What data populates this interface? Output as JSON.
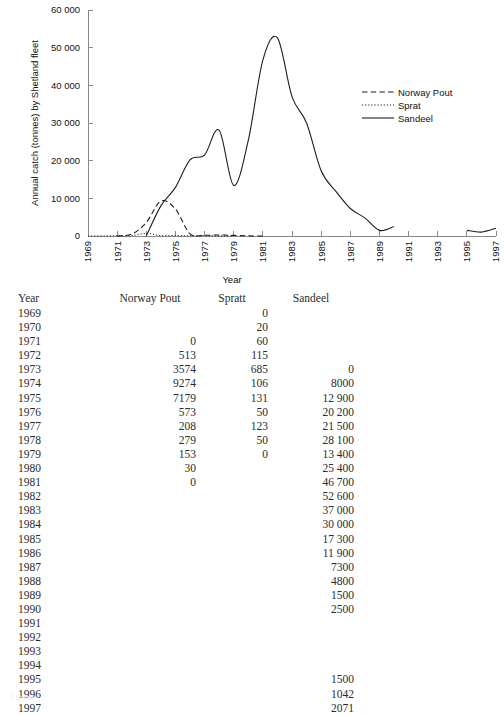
{
  "chart_data": {
    "type": "line",
    "title": "",
    "xlabel": "Year",
    "ylabel": "Annual catch (tonnes) by Shetland fleet",
    "xlim": [
      1969,
      1997
    ],
    "ylim": [
      0,
      60000
    ],
    "grid": false,
    "legend_position": "right",
    "x_ticks": [
      1969,
      1971,
      1973,
      1975,
      1977,
      1979,
      1981,
      1983,
      1985,
      1987,
      1989,
      1991,
      1993,
      1995,
      1997
    ],
    "x_tick_labels": [
      "1969",
      "1971",
      "1973",
      "1975",
      "1977",
      "1979",
      "1981",
      "1983",
      "1985",
      "1987",
      "1989",
      "1991",
      "1993",
      "1995",
      "1997"
    ],
    "y_ticks": [
      0,
      10000,
      20000,
      30000,
      40000,
      50000,
      60000
    ],
    "y_tick_labels": [
      "0",
      "10 000",
      "20 000",
      "30 000",
      "40 000",
      "50 000",
      "60 000"
    ],
    "x": [
      1969,
      1970,
      1971,
      1972,
      1973,
      1974,
      1975,
      1976,
      1977,
      1978,
      1979,
      1980,
      1981,
      1982,
      1983,
      1984,
      1985,
      1986,
      1987,
      1988,
      1989,
      1990,
      1991,
      1992,
      1993,
      1994,
      1995,
      1996,
      1997
    ],
    "series": [
      {
        "name": "Norway Pout",
        "style": "dashed",
        "color": "#1f1f1f",
        "x": [
          1971,
          1972,
          1973,
          1974,
          1975,
          1976,
          1977,
          1978,
          1979,
          1980,
          1981
        ],
        "values": [
          0,
          513,
          3574,
          9274,
          7179,
          573,
          208,
          279,
          153,
          30,
          0
        ]
      },
      {
        "name": "Sprat",
        "style": "dotted",
        "color": "#1f1f1f",
        "x": [
          1969,
          1970,
          1971,
          1972,
          1973,
          1974,
          1975,
          1976,
          1977,
          1978,
          1979
        ],
        "values": [
          0,
          20,
          60,
          115,
          685,
          106,
          131,
          50,
          123,
          50,
          0
        ]
      },
      {
        "name": "Sandeel",
        "style": "solid",
        "color": "#1f1f1f",
        "x": [
          1973,
          1974,
          1975,
          1976,
          1977,
          1978,
          1979,
          1980,
          1981,
          1982,
          1983,
          1984,
          1985,
          1986,
          1987,
          1988,
          1989,
          1990,
          1995,
          1996,
          1997
        ],
        "values": [
          0,
          8000,
          12900,
          20200,
          21500,
          28100,
          13400,
          25400,
          46700,
          52600,
          37000,
          30000,
          17300,
          11900,
          7300,
          4800,
          1500,
          2500,
          1500,
          1042,
          2071
        ]
      }
    ]
  },
  "legend": {
    "items": [
      {
        "label": "Norway Pout",
        "style": "dashed"
      },
      {
        "label": "Sprat",
        "style": "dotted"
      },
      {
        "label": "Sandeel",
        "style": "solid"
      }
    ]
  },
  "table": {
    "headers": [
      "Year",
      "Norway Pout",
      "Spratt",
      "Sandeel"
    ],
    "rows": [
      {
        "year": "1969",
        "pout": "",
        "spratt": "0",
        "sandeel": ""
      },
      {
        "year": "1970",
        "pout": "",
        "spratt": "20",
        "sandeel": ""
      },
      {
        "year": "1971",
        "pout": "0",
        "spratt": "60",
        "sandeel": ""
      },
      {
        "year": "1972",
        "pout": "513",
        "spratt": "115",
        "sandeel": ""
      },
      {
        "year": "1973",
        "pout": "3574",
        "spratt": "685",
        "sandeel": "0"
      },
      {
        "year": "1974",
        "pout": "9274",
        "spratt": "106",
        "sandeel": "8000"
      },
      {
        "year": "1975",
        "pout": "7179",
        "spratt": "131",
        "sandeel": "12 900"
      },
      {
        "year": "1976",
        "pout": "573",
        "spratt": "50",
        "sandeel": "20 200"
      },
      {
        "year": "1977",
        "pout": "208",
        "spratt": "123",
        "sandeel": "21 500"
      },
      {
        "year": "1978",
        "pout": "279",
        "spratt": "50",
        "sandeel": "28 100"
      },
      {
        "year": "1979",
        "pout": "153",
        "spratt": "0",
        "sandeel": "13 400"
      },
      {
        "year": "1980",
        "pout": "30",
        "spratt": "",
        "sandeel": "25 400"
      },
      {
        "year": "1981",
        "pout": "0",
        "spratt": "",
        "sandeel": "46 700"
      },
      {
        "year": "1982",
        "pout": "",
        "spratt": "",
        "sandeel": "52 600"
      },
      {
        "year": "1983",
        "pout": "",
        "spratt": "",
        "sandeel": "37 000"
      },
      {
        "year": "1984",
        "pout": "",
        "spratt": "",
        "sandeel": "30 000"
      },
      {
        "year": "1985",
        "pout": "",
        "spratt": "",
        "sandeel": "17 300"
      },
      {
        "year": "1986",
        "pout": "",
        "spratt": "",
        "sandeel": "11 900"
      },
      {
        "year": "1987",
        "pout": "",
        "spratt": "",
        "sandeel": "7300"
      },
      {
        "year": "1988",
        "pout": "",
        "spratt": "",
        "sandeel": "4800"
      },
      {
        "year": "1989",
        "pout": "",
        "spratt": "",
        "sandeel": "1500"
      },
      {
        "year": "1990",
        "pout": "",
        "spratt": "",
        "sandeel": "2500"
      },
      {
        "year": "1991",
        "pout": "",
        "spratt": "",
        "sandeel": ""
      },
      {
        "year": "1992",
        "pout": "",
        "spratt": "",
        "sandeel": ""
      },
      {
        "year": "1993",
        "pout": "",
        "spratt": "",
        "sandeel": ""
      },
      {
        "year": "1994",
        "pout": "",
        "spratt": "",
        "sandeel": ""
      },
      {
        "year": "1995",
        "pout": "",
        "spratt": "",
        "sandeel": "1500"
      },
      {
        "year": "1996",
        "pout": "",
        "spratt": "",
        "sandeel": "1042"
      },
      {
        "year": "1997",
        "pout": "",
        "spratt": "",
        "sandeel": "2071"
      }
    ]
  },
  "bottom_caption": "Figure"
}
